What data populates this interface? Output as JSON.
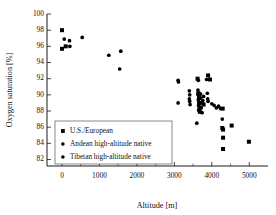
{
  "chart_data": {
    "type": "scatter",
    "title": "",
    "xlabel": "Altitude [m]",
    "ylabel": "Oxygen saturation [%]",
    "xlim": [
      -400,
      5500
    ],
    "ylim": [
      81.2,
      100
    ],
    "xticks": [
      0,
      1000,
      2000,
      3000,
      4000,
      5000
    ],
    "xticklabels": [
      "0",
      "1000",
      "2000",
      "3000",
      "4000",
      "5000"
    ],
    "xminorticks": [
      500,
      1500,
      2500,
      3500,
      4500
    ],
    "yticks": [
      82,
      84,
      86,
      88,
      90,
      92,
      94,
      96,
      98,
      100
    ],
    "yticklabels": [
      "82",
      "84",
      "86",
      "88",
      "90",
      "92",
      "94",
      "96",
      "98",
      "100"
    ],
    "grid": false,
    "legend_position": "lower-left",
    "series": [
      {
        "name": "U.S./European",
        "marker": "square",
        "color": "#000000",
        "points": [
          [
            0,
            98.0
          ],
          [
            0,
            95.7
          ],
          [
            100,
            96.0
          ],
          [
            3620,
            92.0
          ],
          [
            3900,
            92.4
          ],
          [
            3950,
            91.9
          ],
          [
            3640,
            90.2
          ],
          [
            3660,
            89.6
          ],
          [
            3660,
            89.0
          ],
          [
            3670,
            88.4
          ],
          [
            3680,
            87.9
          ],
          [
            3780,
            88.8
          ],
          [
            4280,
            85.9
          ],
          [
            4300,
            85.7
          ],
          [
            4300,
            84.7
          ],
          [
            4300,
            83.3
          ],
          [
            4290,
            88.3
          ],
          [
            4530,
            86.2
          ],
          [
            4990,
            84.2
          ]
        ]
      },
      {
        "name": "Andean high-altitude native",
        "marker": "circle",
        "color": "#000000",
        "points": [
          [
            60,
            96.9
          ],
          [
            200,
            96.7
          ],
          [
            210,
            96.0
          ],
          [
            540,
            97.1
          ],
          [
            1250,
            94.9
          ],
          [
            1570,
            95.4
          ],
          [
            1540,
            93.2
          ],
          [
            3100,
            91.8
          ],
          [
            3110,
            91.6
          ],
          [
            3100,
            89.0
          ],
          [
            3400,
            90.5
          ],
          [
            3410,
            90.0
          ],
          [
            3400,
            89.5
          ],
          [
            3410,
            89.2
          ],
          [
            3420,
            88.8
          ],
          [
            3640,
            91.8
          ],
          [
            3660,
            90.1
          ],
          [
            3700,
            90.1
          ],
          [
            3880,
            90.2
          ],
          [
            3890,
            89.5
          ],
          [
            3900,
            89.2
          ],
          [
            3760,
            89.3
          ],
          [
            3770,
            88.9
          ],
          [
            3780,
            89.8
          ],
          [
            4000,
            88.9
          ],
          [
            4060,
            88.7
          ],
          [
            4120,
            88.4
          ],
          [
            4180,
            88.6
          ],
          [
            4230,
            88.3
          ],
          [
            4280,
            87.0
          ]
        ]
      },
      {
        "name": "Tibetan high-altitude native",
        "marker": "circle",
        "color": "#000000",
        "points": [
          [
            3630,
            90.6
          ],
          [
            3630,
            90.0
          ],
          [
            3640,
            89.4
          ],
          [
            3650,
            88.7
          ],
          [
            3650,
            88.1
          ],
          [
            3700,
            89.6
          ],
          [
            3710,
            89.0
          ],
          [
            3720,
            88.4
          ],
          [
            3740,
            87.8
          ],
          [
            3860,
            91.9
          ],
          [
            3600,
            86.5
          ]
        ]
      }
    ]
  },
  "legend": {
    "entries": [
      {
        "label": "U.S./European",
        "marker": "square"
      },
      {
        "label": "Andean high-altitude native",
        "marker": "circle"
      },
      {
        "label": "Tibetan high-altitude native",
        "marker": "circle"
      }
    ]
  }
}
